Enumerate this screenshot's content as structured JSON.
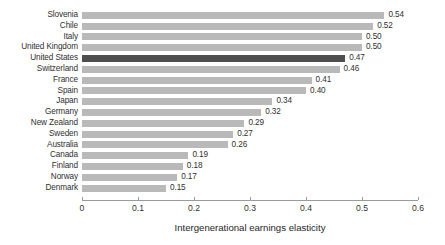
{
  "chart_data": {
    "type": "bar",
    "orientation": "horizontal",
    "title": "",
    "xlabel": "Intergenerational earnings elasticity",
    "ylabel": "",
    "xlim": [
      0,
      0.6
    ],
    "xticks": [
      "0",
      "0.1",
      "0.2",
      "0.3",
      "0.4",
      "0.5",
      "0.6"
    ],
    "xtick_values": [
      0,
      0.1,
      0.2,
      0.3,
      0.4,
      0.5,
      0.6
    ],
    "grid": false,
    "legend": null,
    "categories": [
      "Slovenia",
      "Chile",
      "Italy",
      "United Kingdom",
      "United States",
      "Switzerland",
      "France",
      "Spain",
      "Japan",
      "Germany",
      "New Zealand",
      "Sweden",
      "Australia",
      "Canada",
      "Finland",
      "Norway",
      "Denmark"
    ],
    "values": [
      0.54,
      0.52,
      0.5,
      0.5,
      0.47,
      0.46,
      0.41,
      0.4,
      0.34,
      0.32,
      0.29,
      0.27,
      0.26,
      0.19,
      0.18,
      0.17,
      0.15
    ],
    "data_labels": [
      "0.54",
      "0.52",
      "0.50",
      "0.50",
      "0.47",
      "0.46",
      "0.41",
      "0.40",
      "0.34",
      "0.32",
      "0.29",
      "0.27",
      "0.26",
      "0.19",
      "0.18",
      "0.17",
      "0.15"
    ],
    "highlight_category": "United States",
    "colors": {
      "bar": "#b9b9b9",
      "bar_highlight": "#4f4f4f",
      "axis": "#9a9a9a",
      "text": "#2f2f2f",
      "background": "#ffffff"
    }
  }
}
